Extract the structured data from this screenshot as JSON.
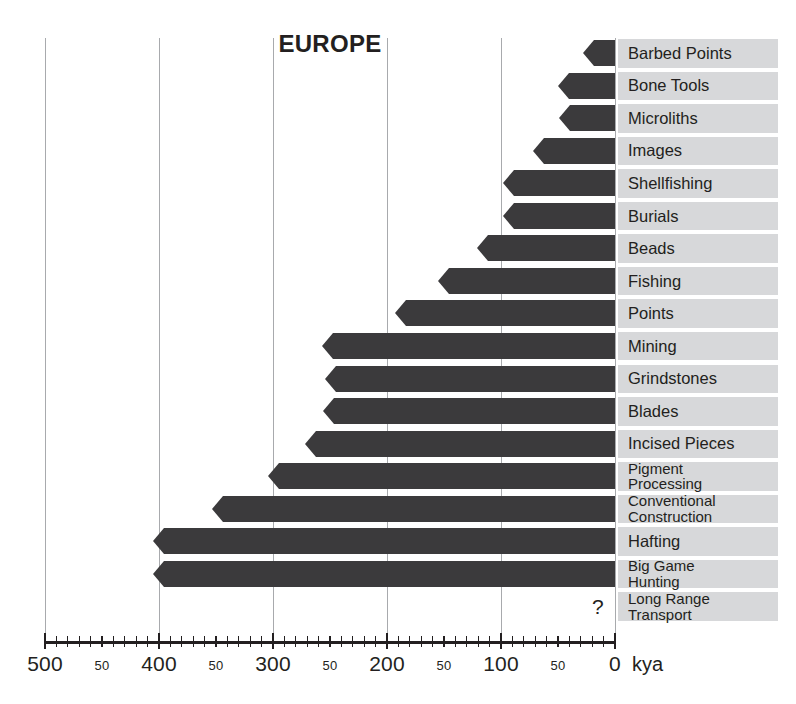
{
  "chart": {
    "title": "EUROPE",
    "unit_label": "kya",
    "question_marker": "?"
  },
  "chart_data": {
    "type": "bar",
    "title": "EUROPE",
    "xlabel": "kya",
    "ylabel": "",
    "orientation": "horizontal",
    "xlim": [
      500,
      0
    ],
    "x_reversed": true,
    "grid": true,
    "gridlines_at": [
      500,
      400,
      300,
      200,
      100,
      0
    ],
    "legend": "none",
    "major_ticks": [
      500,
      400,
      300,
      200,
      100,
      0
    ],
    "minor_tick_interval": 10,
    "tick_labels": [
      "500",
      "50",
      "400",
      "50",
      "300",
      "50",
      "200",
      "50",
      "100",
      "50",
      "0"
    ],
    "tick_label_values": [
      500,
      450,
      400,
      350,
      300,
      250,
      200,
      150,
      100,
      50,
      0
    ],
    "note": "Bars span from the first-appearance date (kya) to present (0 kya). Long Range Transport has no bar, marked with '?'.",
    "categories": [
      "Barbed Points",
      "Bone Tools",
      "Microliths",
      "Images",
      "Shellfishing",
      "Burials",
      "Beads",
      "Fishing",
      "Points",
      "Mining",
      "Grindstones",
      "Blades",
      "Incised Pieces",
      "Pigment Processing",
      "Conventional Construction",
      "Hafting",
      "Big Game Hunting",
      "Long Range Transport"
    ],
    "values": [
      30,
      50,
      49,
      72,
      98,
      98,
      121,
      155,
      193,
      257,
      254,
      256,
      272,
      304,
      353,
      405,
      405,
      null
    ],
    "value_note": "values are start dates in kya (thousands of years ago); null = unknown (shown as '?')"
  },
  "bars": [
    {
      "label": "Barbed Points",
      "start_kya": 30,
      "tip_x": 583,
      "lines": [
        "Barbed Points"
      ]
    },
    {
      "label": "Bone Tools",
      "start_kya": 50,
      "tip_x": 558,
      "lines": [
        "Bone Tools"
      ]
    },
    {
      "label": "Microliths",
      "start_kya": 49,
      "tip_x": 559,
      "lines": [
        "Microliths"
      ]
    },
    {
      "label": "Images",
      "start_kya": 72,
      "tip_x": 533,
      "lines": [
        "Images"
      ]
    },
    {
      "label": "Shellfishing",
      "start_kya": 98,
      "tip_x": 503,
      "lines": [
        "Shellfishing"
      ]
    },
    {
      "label": "Burials",
      "start_kya": 98,
      "tip_x": 503,
      "lines": [
        "Burials"
      ]
    },
    {
      "label": "Beads",
      "start_kya": 121,
      "tip_x": 477,
      "lines": [
        "Beads"
      ]
    },
    {
      "label": "Fishing",
      "start_kya": 155,
      "tip_x": 438,
      "lines": [
        "Fishing"
      ]
    },
    {
      "label": "Points",
      "start_kya": 193,
      "tip_x": 395,
      "lines": [
        "Points"
      ]
    },
    {
      "label": "Mining",
      "start_kya": 257,
      "tip_x": 322,
      "lines": [
        "Mining"
      ]
    },
    {
      "label": "Grindstones",
      "start_kya": 254,
      "tip_x": 325,
      "lines": [
        "Grindstones"
      ]
    },
    {
      "label": "Blades",
      "start_kya": 256,
      "tip_x": 323,
      "lines": [
        "Blades"
      ]
    },
    {
      "label": "Incised Pieces",
      "start_kya": 272,
      "tip_x": 305,
      "lines": [
        "Incised Pieces"
      ]
    },
    {
      "label": "Pigment Processing",
      "start_kya": 304,
      "tip_x": 268,
      "lines": [
        "Pigment",
        "Processing"
      ]
    },
    {
      "label": "Conventional Construction",
      "start_kya": 353,
      "tip_x": 212,
      "lines": [
        "Conventional",
        "Construction"
      ]
    },
    {
      "label": "Hafting",
      "start_kya": 405,
      "tip_x": 153,
      "lines": [
        "Hafting"
      ]
    },
    {
      "label": "Big Game Hunting",
      "start_kya": 405,
      "tip_x": 153,
      "lines": [
        "Big Game",
        "Hunting"
      ]
    },
    {
      "label": "Long Range Transport",
      "start_kya": null,
      "tip_x": null,
      "lines": [
        "Long Range",
        "Transport"
      ]
    }
  ],
  "colors": {
    "bar": "#3b3a3c",
    "label_box": "#d7d8da",
    "gridline": "#a8aaad",
    "axis": "#231f20",
    "background": "#ffffff"
  }
}
